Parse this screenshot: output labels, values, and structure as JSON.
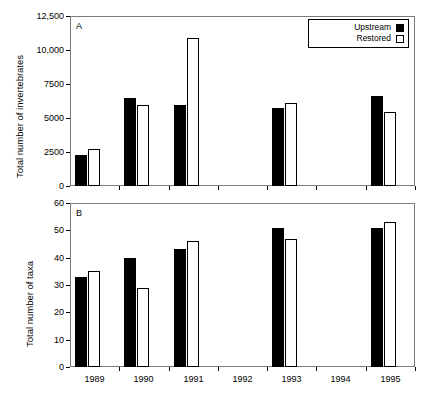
{
  "figure": {
    "background": "#ffffff",
    "series_colors": {
      "upstream": "#000000",
      "restored": "#ffffff",
      "outline": "#000000"
    }
  },
  "legend": {
    "position": "top-right",
    "entries": [
      {
        "label": "Upstream",
        "style": "filled"
      },
      {
        "label": "Restored",
        "style": "open"
      }
    ]
  },
  "panels": [
    {
      "letter": "A",
      "ylabel": "Total number of invertebrates",
      "yticks": [
        "0",
        "2500",
        "5000",
        "7500",
        "10,000",
        "12,500"
      ]
    },
    {
      "letter": "B",
      "ylabel": "Total number of taxa",
      "yticks": [
        "0",
        "10",
        "20",
        "30",
        "40",
        "50",
        "60"
      ]
    }
  ],
  "xticks": [
    "1989",
    "1990",
    "1991",
    "1992",
    "1993",
    "1994",
    "1995"
  ],
  "chart_data": [
    {
      "type": "bar",
      "panel": "A",
      "title": "",
      "xlabel": "",
      "ylabel": "Total number of invertebrates",
      "categories": [
        "1989",
        "1990",
        "1991",
        "1992",
        "1993",
        "1994",
        "1995"
      ],
      "ylim": [
        0,
        12500
      ],
      "ytick_values": [
        0,
        2500,
        5000,
        7500,
        10000,
        12500
      ],
      "grid": false,
      "legend_position": "top-right",
      "series": [
        {
          "name": "Upstream",
          "values": [
            2300,
            6500,
            5950,
            null,
            5750,
            null,
            6650
          ]
        },
        {
          "name": "Restored",
          "values": [
            2700,
            5950,
            10900,
            null,
            6100,
            null,
            5450
          ]
        }
      ]
    },
    {
      "type": "bar",
      "panel": "B",
      "title": "",
      "xlabel": "",
      "ylabel": "Total number of taxa",
      "categories": [
        "1989",
        "1990",
        "1991",
        "1992",
        "1993",
        "1994",
        "1995"
      ],
      "ylim": [
        0,
        60
      ],
      "ytick_values": [
        0,
        10,
        20,
        30,
        40,
        50,
        60
      ],
      "grid": false,
      "legend_position": "none",
      "series": [
        {
          "name": "Upstream",
          "values": [
            33,
            40,
            43,
            null,
            51,
            null,
            51
          ]
        },
        {
          "name": "Restored",
          "values": [
            35,
            29,
            46,
            null,
            47,
            null,
            53
          ]
        }
      ]
    }
  ]
}
